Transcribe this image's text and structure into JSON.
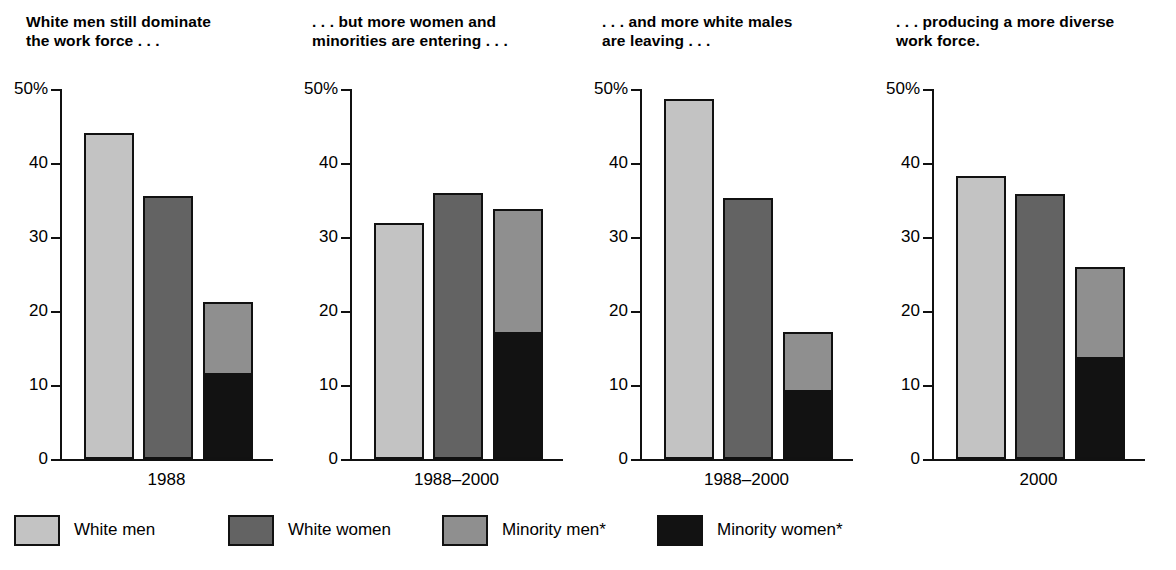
{
  "colors": {
    "white_men": "#c3c3c3",
    "white_women": "#636363",
    "minority_men": "#8f8f8f",
    "minority_women": "#121212",
    "axis": "#111111",
    "background": "#ffffff"
  },
  "legend": {
    "items": [
      {
        "label": "White men",
        "color": "#c3c3c3",
        "swatch_name": "legend-swatch-white-men"
      },
      {
        "label": "White women",
        "color": "#636363",
        "swatch_name": "legend-swatch-white-women"
      },
      {
        "label": "Minority men*",
        "color": "#8f8f8f",
        "swatch_name": "legend-swatch-minority-men"
      },
      {
        "label": "Minority women*",
        "color": "#121212",
        "swatch_name": "legend-swatch-minority-women"
      }
    ]
  },
  "panels": [
    {
      "title": "White men still dominate\nthe work force . . .",
      "category": "1988",
      "ytick_labels": [
        "50%",
        "40",
        "30",
        "20",
        "10",
        "0"
      ]
    },
    {
      "title": ". . . but more women and\nminorities are entering . . .",
      "category": "1988–2000",
      "ytick_labels": [
        "50%",
        "40",
        "30",
        "20",
        "10",
        "0"
      ]
    },
    {
      "title": ". . . and more white males\nare leaving . . .",
      "category": "1988–2000",
      "ytick_labels": [
        "50%",
        "40",
        "30",
        "20",
        "10",
        "0"
      ]
    },
    {
      "title": ". . . producing a more diverse\nwork force.",
      "category": "2000",
      "ytick_labels": [
        "50%",
        "40",
        "30",
        "20",
        "10",
        "0"
      ]
    }
  ],
  "chart_data": [
    {
      "type": "bar",
      "title": "White men still dominate the work force . . .",
      "xlabel": "1988",
      "ylabel": "Percent of work force",
      "ylim": [
        0,
        50
      ],
      "yticks": [
        0,
        10,
        20,
        30,
        40,
        50
      ],
      "grid": false,
      "stacked": true,
      "categories": [
        "White men",
        "White women",
        "Minority"
      ],
      "bars": [
        {
          "label": "White men",
          "segments": [
            {
              "name": "White men",
              "value": 44.0,
              "color": "#c3c3c3"
            }
          ],
          "total": 44.0
        },
        {
          "label": "White women",
          "segments": [
            {
              "name": "White women",
              "value": 35.6,
              "color": "#636363"
            }
          ],
          "total": 35.6
        },
        {
          "label": "Minority",
          "segments": [
            {
              "name": "Minority women*",
              "value": 11.7,
              "color": "#121212"
            },
            {
              "name": "Minority men*",
              "value": 9.5,
              "color": "#8f8f8f"
            }
          ],
          "total": 21.2
        }
      ]
    },
    {
      "type": "bar",
      "title": ". . . but more women and minorities are entering . . .",
      "xlabel": "1988–2000",
      "ylabel": "Percent of work force entrants",
      "ylim": [
        0,
        50
      ],
      "yticks": [
        0,
        10,
        20,
        30,
        40,
        50
      ],
      "grid": false,
      "stacked": true,
      "categories": [
        "White men",
        "White women",
        "Minority"
      ],
      "bars": [
        {
          "label": "White men",
          "segments": [
            {
              "name": "White men",
              "value": 31.9,
              "color": "#c3c3c3"
            }
          ],
          "total": 31.9
        },
        {
          "label": "White women",
          "segments": [
            {
              "name": "White women",
              "value": 35.9,
              "color": "#636363"
            }
          ],
          "total": 35.9
        },
        {
          "label": "Minority",
          "segments": [
            {
              "name": "Minority women*",
              "value": 17.2,
              "color": "#121212"
            },
            {
              "name": "Minority men*",
              "value": 16.6,
              "color": "#8f8f8f"
            }
          ],
          "total": 33.8
        }
      ]
    },
    {
      "type": "bar",
      "title": ". . . and more white males are leaving . . .",
      "xlabel": "1988–2000",
      "ylabel": "Percent of work force leavers",
      "ylim": [
        0,
        50
      ],
      "yticks": [
        0,
        10,
        20,
        30,
        40,
        50
      ],
      "grid": false,
      "stacked": true,
      "categories": [
        "White men",
        "White women",
        "Minority"
      ],
      "bars": [
        {
          "label": "White men",
          "segments": [
            {
              "name": "White men",
              "value": 48.6,
              "color": "#c3c3c3"
            }
          ],
          "total": 48.6
        },
        {
          "label": "White women",
          "segments": [
            {
              "name": "White women",
              "value": 35.3,
              "color": "#636363"
            }
          ],
          "total": 35.3
        },
        {
          "label": "Minority",
          "segments": [
            {
              "name": "Minority women*",
              "value": 9.3,
              "color": "#121212"
            },
            {
              "name": "Minority men*",
              "value": 7.8,
              "color": "#8f8f8f"
            }
          ],
          "total": 17.1
        }
      ]
    },
    {
      "type": "bar",
      "title": ". . . producing a more diverse work force.",
      "xlabel": "2000",
      "ylabel": "Percent of work force",
      "ylim": [
        0,
        50
      ],
      "yticks": [
        0,
        10,
        20,
        30,
        40,
        50
      ],
      "grid": false,
      "stacked": true,
      "categories": [
        "White men",
        "White women",
        "Minority"
      ],
      "bars": [
        {
          "label": "White men",
          "segments": [
            {
              "name": "White men",
              "value": 38.3,
              "color": "#c3c3c3"
            }
          ],
          "total": 38.3
        },
        {
          "label": "White women",
          "segments": [
            {
              "name": "White women",
              "value": 35.8,
              "color": "#636363"
            }
          ],
          "total": 35.8
        },
        {
          "label": "Minority",
          "segments": [
            {
              "name": "Minority women*",
              "value": 13.8,
              "color": "#121212"
            },
            {
              "name": "Minority men*",
              "value": 12.1,
              "color": "#8f8f8f"
            }
          ],
          "total": 25.9
        }
      ]
    }
  ]
}
